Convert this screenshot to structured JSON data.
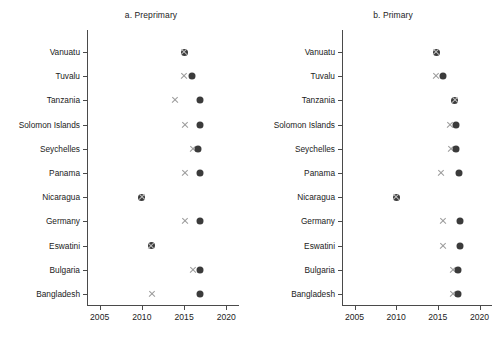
{
  "chart_data": {
    "type": "scatter",
    "title": "",
    "panels": [
      {
        "key": "a",
        "title": "a. Preprimary",
        "xlabel": "",
        "ylabel": "",
        "xlim": [
          2003.5,
          2021.5
        ],
        "xticks": [
          2005,
          2010,
          2015,
          2020
        ],
        "xticklabels": [
          "2005",
          "2010",
          "2015",
          "2020"
        ],
        "grid": false,
        "categories": [
          "Vanuatu",
          "Tuvalu",
          "Tanzania",
          "Solomon Islands",
          "Seychelles",
          "Panama",
          "Nicaragua",
          "Germany",
          "Eswatini",
          "Bulgaria",
          "Bangladesh"
        ],
        "series": [
          {
            "name": "first-year",
            "marker": "cross",
            "color": "#9b9b9b",
            "values": [
              2015.0,
              2015.0,
              2013.9,
              2015.1,
              2016.0,
              2015.1,
              2010.0,
              2015.1,
              2011.1,
              2016.0,
              2011.2
            ]
          },
          {
            "name": "latest-year",
            "marker": "dot",
            "color": "#3b3b3b",
            "values": [
              2015.0,
              2015.9,
              2016.9,
              2016.9,
              2016.6,
              2016.9,
              2010.0,
              2016.9,
              2011.1,
              2016.9,
              2016.9
            ]
          }
        ]
      },
      {
        "key": "b",
        "title": "b. Primary",
        "xlabel": "",
        "ylabel": "",
        "xlim": [
          2003.5,
          2021.5
        ],
        "xticks": [
          2005,
          2010,
          2015,
          2020
        ],
        "xticklabels": [
          "2005",
          "2010",
          "2015",
          "2020"
        ],
        "grid": false,
        "categories": [
          "Vanuatu",
          "Tuvalu",
          "Tanzania",
          "Solomon Islands",
          "Seychelles",
          "Panama",
          "Nicaragua",
          "Germany",
          "Eswatini",
          "Bulgaria",
          "Bangladesh"
        ],
        "series": [
          {
            "name": "first-year",
            "marker": "cross",
            "color": "#9b9b9b",
            "values": [
              2014.8,
              2014.8,
              2017.0,
              2016.5,
              2016.6,
              2015.4,
              2010.0,
              2015.6,
              2015.6,
              2016.8,
              2016.8
            ]
          },
          {
            "name": "latest-year",
            "marker": "dot",
            "color": "#3b3b3b",
            "values": [
              2014.8,
              2015.6,
              2017.0,
              2017.2,
              2017.2,
              2017.5,
              2010.0,
              2017.7,
              2017.7,
              2017.4,
              2017.4
            ]
          }
        ]
      }
    ]
  }
}
